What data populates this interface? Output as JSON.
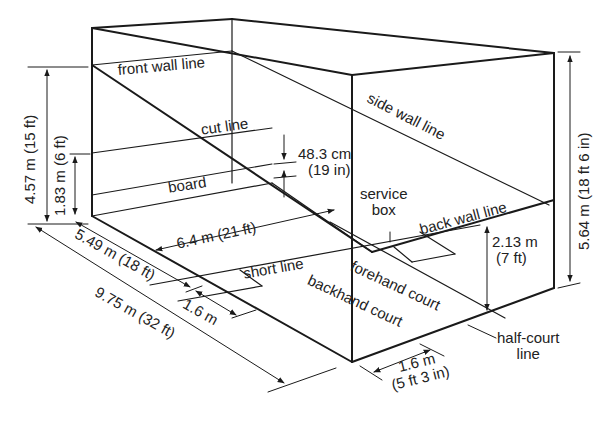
{
  "diagram": {
    "labels": {
      "front_wall_line": "front wall line",
      "cut_line": "cut line",
      "board": "board",
      "side_wall_line": "side wall line",
      "service_box_1": "service",
      "service_box_2": "box",
      "back_wall_line": "back wall line",
      "short_line": "short line",
      "forehand_court": "forehand court",
      "backhand_court": "backhand court",
      "half_court_line_1": "half-court",
      "half_court_line_2": "line"
    },
    "dimensions": {
      "front_wall_height": "4.57 m (15 ft)",
      "cut_line_height": "1.83 m (6 ft)",
      "board_height_1": "48.3 cm",
      "board_height_2": "(19 in)",
      "court_width": "6.4 m (21 ft)",
      "front_to_short": "5.49 m (18 ft)",
      "service_box_depth": "1.6 m",
      "court_length": "9.75 m  (32 ft)",
      "back_wall_height_1": "2.13 m",
      "back_wall_height_2": "(7 ft)",
      "side_wall_front_height": "5.64 m (18 ft 6 in)",
      "service_box_width_1": "1.6 m",
      "service_box_width_2": "(5 ft 3 in)"
    },
    "colors": {
      "line": "#1a1a1a",
      "background": "#ffffff"
    }
  }
}
